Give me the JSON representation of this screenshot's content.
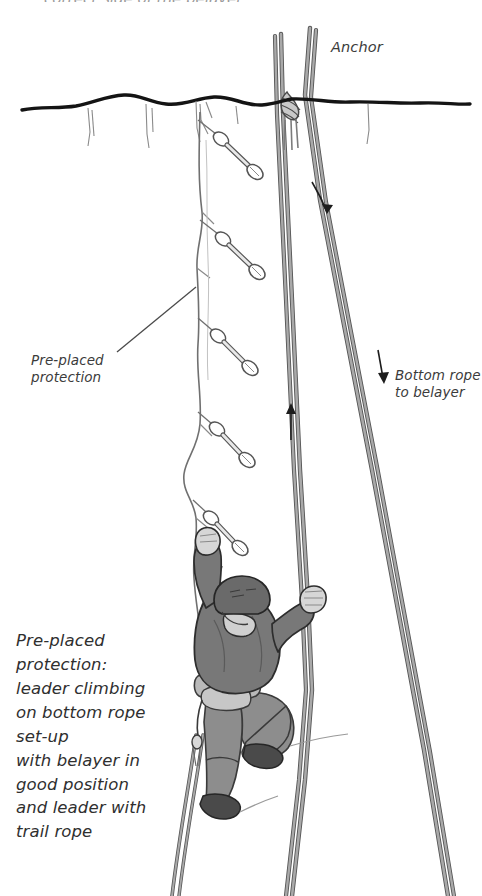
{
  "figure": {
    "type": "instructional-diagram",
    "background_color": "#ffffff",
    "ink_color": "#222222"
  },
  "partial_top_text": "correct side of the belayer.",
  "labels": {
    "anchor": "Anchor",
    "preplaced_protection": "Pre-placed\nprotection",
    "bottom_rope": "Bottom rope\nto belayer"
  },
  "caption": {
    "lines": [
      "Pre-placed",
      "protection:",
      "leader climbing",
      "on bottom rope",
      "set-up",
      "with belayer in",
      "good position",
      "and leader with",
      "trail rope"
    ],
    "text": "Pre-placed\nprotection:\nleader climbing\non bottom rope\nset-up\nwith belayer in\ngood position\nand leader with\ntrail rope"
  },
  "colors": {
    "rope": "#8d8d8d",
    "rope_outline": "#555555",
    "cliff_edge": "#141414",
    "crack_line": "#6e6e6e",
    "shirt": "#787878",
    "pants": "#8a8a8a",
    "helmet": "#6a6a6a",
    "harness": "#b9b9b9",
    "skin": "#d6d6d6",
    "shoe": "#4a4a4a",
    "label": "#3b3b3b"
  },
  "elements": {
    "protection_count": 5,
    "protection_name": "quickdraw",
    "anchor_knot": "figure-eight anchor knot",
    "arrows": [
      {
        "name": "rope-down-arrow-upper",
        "direction": "down"
      },
      {
        "name": "rope-up-arrow",
        "direction": "up"
      },
      {
        "name": "rope-down-arrow-lower",
        "direction": "down"
      }
    ],
    "climber": "lead climber ascending cliff edge with trail rope"
  }
}
